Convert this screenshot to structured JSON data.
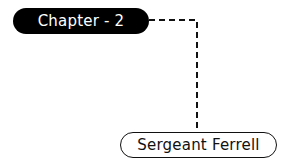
{
  "diagram": {
    "type": "mind-map",
    "nodes": [
      {
        "id": "root",
        "label": "Chapter - 2",
        "style": "filled",
        "fill": "#000000",
        "text_color": "#ffffff"
      },
      {
        "id": "child",
        "label": "Sergeant Ferrell",
        "style": "outlined",
        "fill": "#ffffff",
        "text_color": "#111111"
      }
    ],
    "edges": [
      {
        "from": "root",
        "to": "child",
        "style": "dashed",
        "color": "#111111"
      }
    ]
  }
}
